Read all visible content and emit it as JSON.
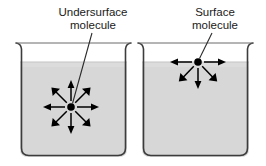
{
  "figure": {
    "background_color": "#ffffff",
    "width": 266,
    "height": 166
  },
  "colors": {
    "liquid_fill": "#d7d7d7",
    "liquid_fill_top": "#dcdcdc",
    "beaker_outline": "#3c3c3c",
    "arrow": "#000000",
    "molecule": "#000000",
    "leader_line": "#2b2b2b",
    "text": "#1a1a1a"
  },
  "panels": [
    {
      "id": "undersurface-panel",
      "label": {
        "line1": "Undersurface",
        "line2": "molecule",
        "anchor_x": 93,
        "line1_y": 14,
        "line2_y": 28
      },
      "leader_line": {
        "x1": 92,
        "y1": 32,
        "x2": 72,
        "y2": 103
      },
      "beaker": {
        "left": 20,
        "right": 127,
        "top": 42,
        "bottom": 157,
        "rim_flare": 5,
        "liquid_level": 62,
        "corner_radius": 8
      },
      "molecule": {
        "cx": 71,
        "cy": 107,
        "r": 3.6
      },
      "arrows": [
        {
          "name": "arrow-right",
          "angle_deg": 0,
          "length": 25
        },
        {
          "name": "arrow-up-right",
          "angle_deg": 45,
          "length": 24
        },
        {
          "name": "arrow-up",
          "angle_deg": 90,
          "length": 26
        },
        {
          "name": "arrow-up-left",
          "angle_deg": 135,
          "length": 24
        },
        {
          "name": "arrow-left",
          "angle_deg": 180,
          "length": 25
        },
        {
          "name": "arrow-down-left",
          "angle_deg": 225,
          "length": 24
        },
        {
          "name": "arrow-down",
          "angle_deg": 270,
          "length": 26
        },
        {
          "name": "arrow-down-right",
          "angle_deg": 315,
          "length": 24
        }
      ],
      "arrow_count": 8
    },
    {
      "id": "surface-panel",
      "label": {
        "line1": "Surface",
        "line2": "molecule",
        "anchor_x": 215,
        "line1_y": 14,
        "line2_y": 28
      },
      "leader_line": {
        "x1": 212,
        "y1": 32,
        "x2": 200,
        "y2": 59
      },
      "beaker": {
        "left": 142,
        "right": 249,
        "top": 42,
        "bottom": 157,
        "rim_flare": 5,
        "liquid_level": 62,
        "corner_radius": 8
      },
      "molecule": {
        "cx": 198,
        "cy": 62,
        "r": 3.6
      },
      "arrows": [
        {
          "name": "arrow-right",
          "angle_deg": 0,
          "length": 25
        },
        {
          "name": "arrow-left",
          "angle_deg": 180,
          "length": 25
        },
        {
          "name": "arrow-down-left",
          "angle_deg": 222,
          "length": 24
        },
        {
          "name": "arrow-down",
          "angle_deg": 270,
          "length": 26
        },
        {
          "name": "arrow-down-right",
          "angle_deg": 318,
          "length": 24
        }
      ],
      "arrow_count": 5
    }
  ]
}
